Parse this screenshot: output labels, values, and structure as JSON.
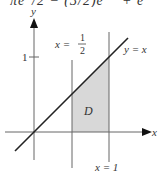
{
  "header_fragment": {
    "left": "πe",
    "middle": "/2  −  (3/2)e",
    "right": "+ e"
  },
  "figure": {
    "axis_x_label": "x",
    "axis_y_label": "y",
    "tick_y_label": "1",
    "line_half_label": "x =",
    "half_num": "1",
    "half_den": "2",
    "line_diag_label": "y = x",
    "line_one_label": "x = 1",
    "region_label": "D",
    "colors": {
      "line": "#222222",
      "axis": "#555555",
      "vertical": "#666666",
      "region_fill": "#d8d8d8"
    }
  }
}
